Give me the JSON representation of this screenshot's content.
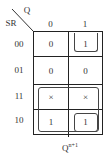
{
  "kmap": {
    "row_var": "SR",
    "col_var": "Q",
    "col_labels": [
      "0",
      "1"
    ],
    "row_labels": [
      "00",
      "01",
      "11",
      "10"
    ],
    "cells": [
      [
        "0",
        "1"
      ],
      [
        "0",
        "0"
      ],
      [
        "×",
        "×"
      ],
      [
        "1",
        "1"
      ]
    ],
    "output_label": "Q",
    "output_sup": "n+1",
    "groups": [
      {
        "description": "SR=00, Q=1 (single cell)"
      },
      {
        "description": "SR=11 and SR=10, both columns (quad)"
      },
      {
        "description": "SR=10, Q=1 (single cell)"
      }
    ]
  }
}
